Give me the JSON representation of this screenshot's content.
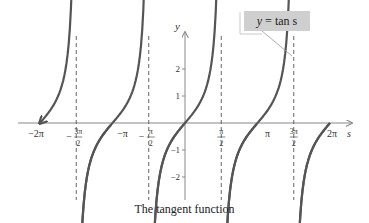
{
  "chart_data": {
    "type": "line",
    "title": "The tangent function",
    "function": "y = tan s",
    "xlabel": "s",
    "ylabel": "y",
    "xlim": [
      -6.9,
      7.0
    ],
    "ylim": [
      -3.3,
      3.3
    ],
    "x_ticks": [
      {
        "value": -6.2832,
        "label": "-2π"
      },
      {
        "value": -4.7124,
        "label": "-3π/2"
      },
      {
        "value": -3.1416,
        "label": "-π"
      },
      {
        "value": -1.5708,
        "label": "-π/2"
      },
      {
        "value": 1.5708,
        "label": "π/2"
      },
      {
        "value": 3.1416,
        "label": "π"
      },
      {
        "value": 4.7124,
        "label": "3π/2"
      },
      {
        "value": 6.2832,
        "label": "2π"
      }
    ],
    "y_ticks": [
      -2,
      -1,
      1,
      2
    ],
    "asymptotes": [
      -4.7124,
      -1.5708,
      1.5708,
      4.7124
    ],
    "series": [
      {
        "name": "tan s",
        "branches": [
          {
            "domain": [
              -6.2832,
              -4.85
            ]
          },
          {
            "domain": [
              -4.58,
              -1.71
            ]
          },
          {
            "domain": [
              -1.43,
              1.43
            ]
          },
          {
            "domain": [
              1.71,
              4.58
            ]
          },
          {
            "domain": [
              4.85,
              6.2832
            ]
          }
        ]
      }
    ],
    "grid": false,
    "legend": {
      "text": "y = tan s",
      "position": "top-right callout"
    }
  },
  "labels": {
    "legend_var": "y",
    "legend_rest": "= tan s",
    "caption": "The tangent function"
  },
  "colors": {
    "curve": "#555555",
    "axis": "#888888",
    "asymptote": "#555555",
    "legend_bg": "#cfcfcf"
  }
}
